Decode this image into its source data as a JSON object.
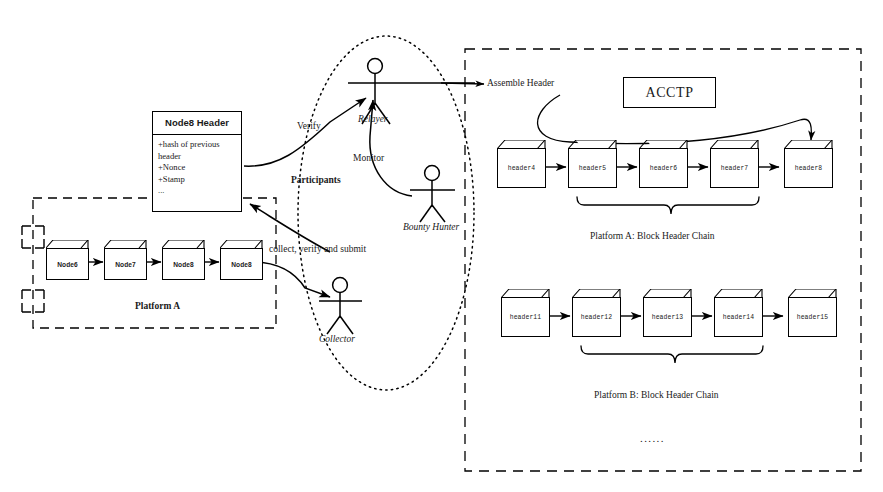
{
  "diagram": {
    "acctp_label": "ACCTP"
  },
  "header_class": {
    "name": "Node8 Header",
    "attributes": [
      "+hash of previous",
      "header",
      "+Nonce",
      "+Stamp",
      "..."
    ]
  },
  "platform_a": {
    "caption": "Platform A",
    "nodes": [
      {
        "label": "Node6"
      },
      {
        "label": "Node7"
      },
      {
        "label": "Node8"
      },
      {
        "label": "Node8"
      }
    ]
  },
  "participants": {
    "group_label": "Participants",
    "actors": [
      {
        "name": "relayer",
        "label": "Relayer"
      },
      {
        "name": "bounty-hunter",
        "label": "Bounty Hunter"
      },
      {
        "name": "collector",
        "label": "Collector"
      }
    ],
    "flows": [
      {
        "name": "verify",
        "label": "Verify"
      },
      {
        "name": "monitor",
        "label": "Monitor"
      },
      {
        "name": "collect-verify-submit",
        "label": "collect, verify and submit"
      },
      {
        "name": "assemble-header",
        "label": "Assemble Header"
      }
    ]
  },
  "chains": [
    {
      "name": "platform-a-header-chain",
      "caption": "Platform A: Block Header Chain",
      "headers": [
        {
          "label": "header4"
        },
        {
          "label": "header5"
        },
        {
          "label": "header6"
        },
        {
          "label": "header7"
        },
        {
          "label": "header8"
        }
      ]
    },
    {
      "name": "platform-b-header-chain",
      "caption": "Platform B: Block Header Chain",
      "headers": [
        {
          "label": "header11"
        },
        {
          "label": "header12"
        },
        {
          "label": "header13"
        },
        {
          "label": "header14"
        },
        {
          "label": "header15"
        }
      ]
    }
  ],
  "ellipsis": "......",
  "colors": {
    "stroke": "#000000",
    "background": "#ffffff",
    "text": "#1a1a1a"
  }
}
